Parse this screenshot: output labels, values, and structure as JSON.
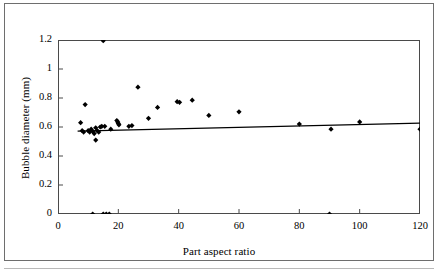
{
  "chart_data": {
    "type": "scatter",
    "title": "",
    "xlabel": "Part aspect ratio",
    "ylabel": "Bubble diameter (mm)",
    "xlim": [
      0,
      120
    ],
    "ylim": [
      0,
      1.2
    ],
    "xticks": [
      0,
      20,
      40,
      60,
      80,
      100,
      120
    ],
    "xtick_labels": [
      "0",
      "20",
      "40",
      "60",
      "80",
      "100",
      "120"
    ],
    "yticks": [
      0,
      0.2,
      0.4,
      0.6,
      0.8,
      1,
      1.2
    ],
    "ytick_labels": [
      "0",
      "0.2",
      "0.4",
      "0.6",
      "0.8",
      "1",
      "1.2"
    ],
    "grid": false,
    "legend": null,
    "series": [
      {
        "name": "Bubble diameter measurements",
        "marker": "filled-diamond",
        "color": "#000000",
        "points": [
          [
            7.5,
            0.63
          ],
          [
            8.0,
            0.575
          ],
          [
            8.5,
            0.565
          ],
          [
            9.0,
            0.755
          ],
          [
            10.0,
            0.575
          ],
          [
            10.5,
            0.565
          ],
          [
            11.0,
            0.585
          ],
          [
            11.5,
            0.57
          ],
          [
            11.5,
            0.0
          ],
          [
            12.0,
            0.555
          ],
          [
            12.5,
            0.595
          ],
          [
            12.5,
            0.51
          ],
          [
            13.0,
            0.575
          ],
          [
            13.5,
            0.565
          ],
          [
            14.0,
            0.6
          ],
          [
            14.5,
            0.605
          ],
          [
            15.0,
            1.195
          ],
          [
            15.0,
            0.0
          ],
          [
            15.5,
            0.605
          ],
          [
            16.0,
            0.0
          ],
          [
            17.0,
            0.0
          ],
          [
            17.5,
            0.585
          ],
          [
            19.5,
            0.645
          ],
          [
            19.8,
            0.635
          ],
          [
            20.0,
            0.625
          ],
          [
            20.2,
            0.615
          ],
          [
            23.5,
            0.605
          ],
          [
            24.5,
            0.61
          ],
          [
            26.5,
            0.875
          ],
          [
            30.0,
            0.66
          ],
          [
            33.0,
            0.735
          ],
          [
            39.5,
            0.775
          ],
          [
            40.3,
            0.77
          ],
          [
            44.5,
            0.785
          ],
          [
            50.0,
            0.68
          ],
          [
            60.0,
            0.705
          ],
          [
            80.0,
            0.62
          ],
          [
            90.0,
            0.0
          ],
          [
            90.5,
            0.585
          ],
          [
            100.0,
            0.635
          ],
          [
            120.0,
            0.585
          ]
        ]
      }
    ],
    "trendline": {
      "name": "linear fit",
      "color": "#000000",
      "x_start": 6.5,
      "y_start": 0.572,
      "x_end": 120,
      "y_end": 0.627
    }
  }
}
